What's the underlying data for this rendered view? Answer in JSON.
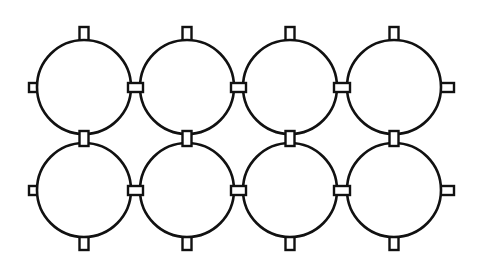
{
  "diagram": {
    "type": "grid of circles with rectangular connector tabs",
    "rows": 2,
    "columns": 4,
    "stroke_color": "#111111",
    "background_color": "#ffffff",
    "circle_radius": 47,
    "column_centers_x": [
      84,
      187,
      290,
      394
    ],
    "row_centers_y": [
      87,
      190
    ],
    "tab_size": {
      "long": 16,
      "short": 9
    },
    "elements": {
      "circles": 8,
      "top_tabs": 4,
      "bottom_tabs": 4,
      "vertical_connectors_between_rows": 4,
      "horizontal_connectors_between_columns": 6,
      "left_edge_tabs": 2,
      "right_edge_tabs": 2
    }
  }
}
